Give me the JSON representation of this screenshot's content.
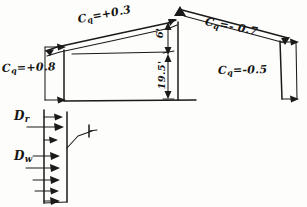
{
  "diagram": {
    "ink_color": "#1a1a1a",
    "paper_color": "#fdfdfb"
  },
  "pressure_labels": {
    "windward_wall": {
      "symbol": "C",
      "subscript": "q",
      "equals": "=",
      "value": "+0.8",
      "text": "Cq = +0.8"
    },
    "windward_roof": {
      "symbol": "C",
      "subscript": "q",
      "equals": "=",
      "value": "+0.3",
      "text": "Cq = +0.3"
    },
    "leeward_roof": {
      "symbol": "C",
      "subscript": "q",
      "equals": "=",
      "value": "- 0.7",
      "text": "Cq = - 0.7"
    },
    "leeward_wall": {
      "symbol": "C",
      "subscript": "q",
      "equals": "=",
      "value": "-0.5",
      "text": "Cq = -0.5"
    }
  },
  "dimensions": {
    "roof_rise": "6'",
    "eave_height": "19.5'"
  },
  "load_labels": {
    "roof_dead_load": {
      "symbol": "D",
      "subscript": "r",
      "text": "Dr"
    },
    "wall_dead_load": {
      "symbol": "D",
      "subscript": "w",
      "text": "Dw"
    }
  }
}
